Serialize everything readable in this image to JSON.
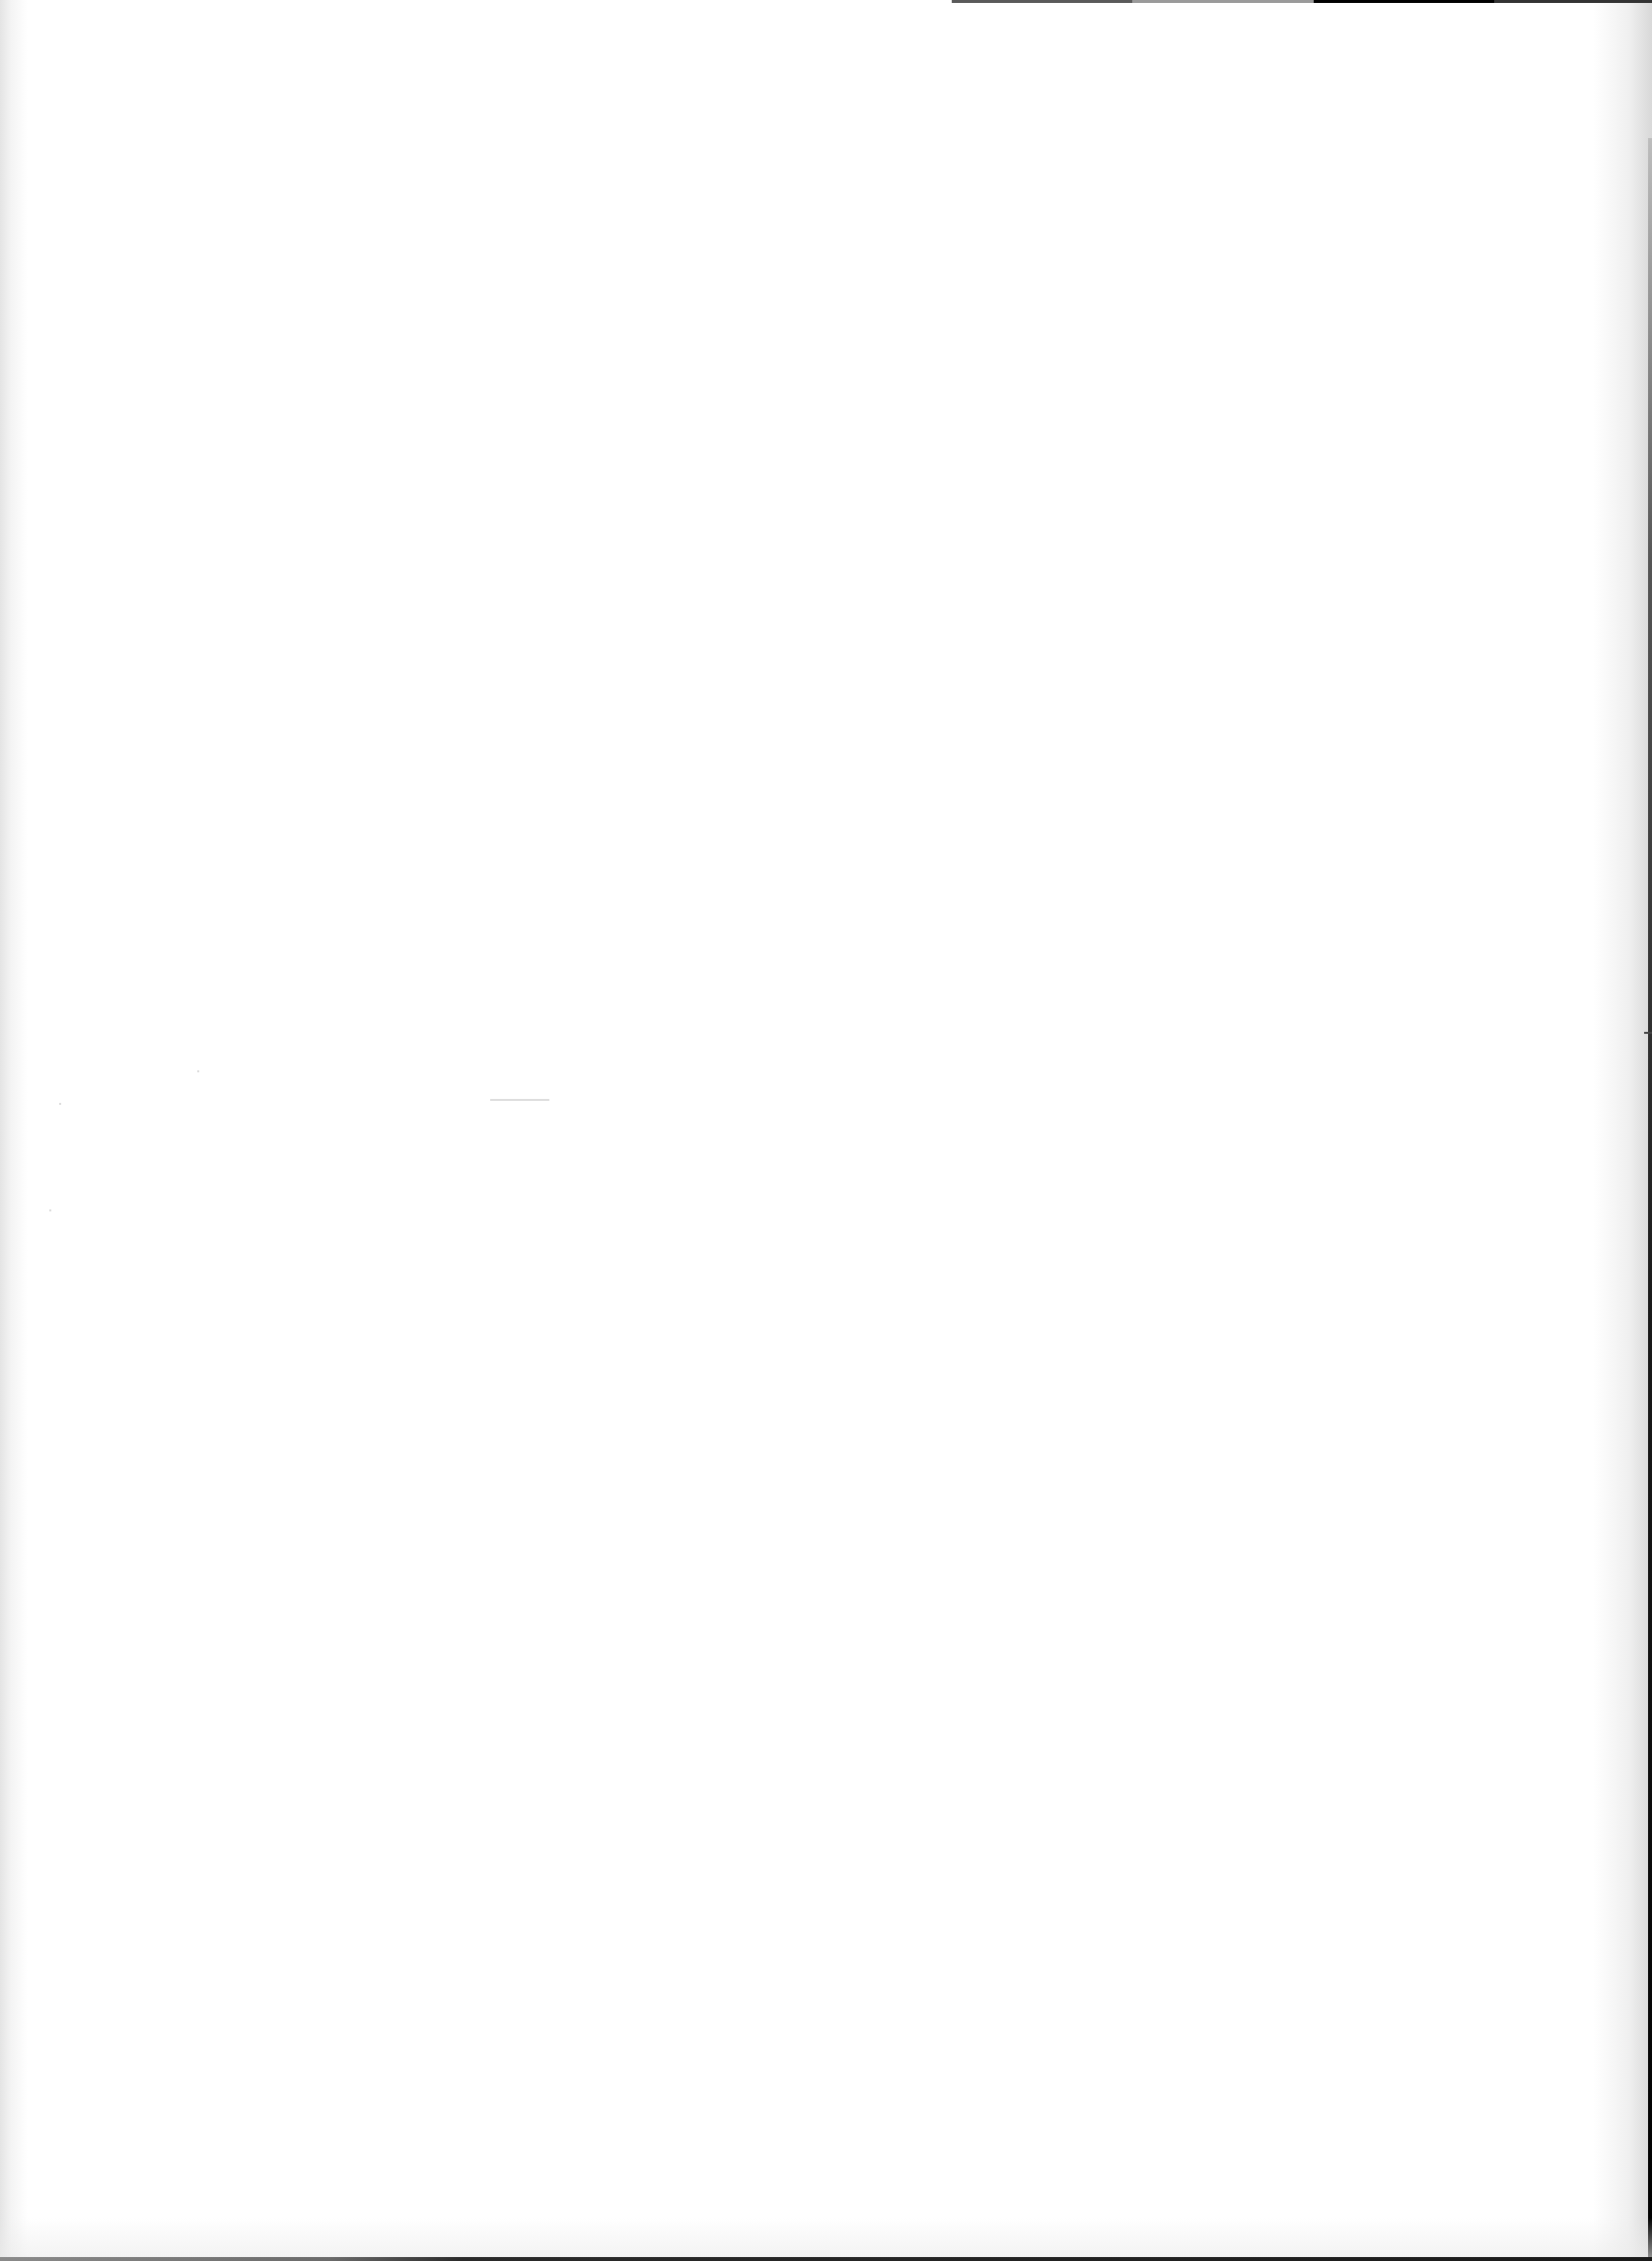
{
  "document": {
    "type": "scanned-page",
    "content_state": "blank",
    "text": "",
    "background_color": "#ffffff",
    "artifacts": [
      "top-right-dark-strip",
      "right-edge-dark-border",
      "bottom-edge-dark-border",
      "left-edge-shading",
      "stray-dash-mid-left",
      "right-edge-tick"
    ]
  }
}
